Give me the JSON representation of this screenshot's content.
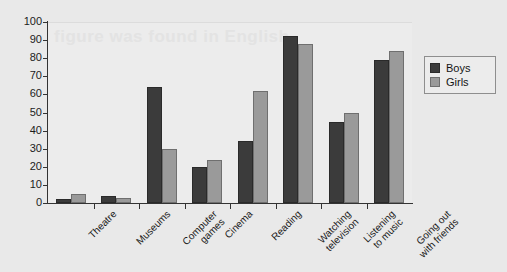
{
  "chart_data": {
    "type": "bar",
    "title": "",
    "xlabel": "",
    "ylabel": "",
    "ylim": [
      0,
      100
    ],
    "ytick_step": 10,
    "yticks": [
      0,
      10,
      20,
      30,
      40,
      50,
      60,
      70,
      80,
      90,
      100
    ],
    "grid": false,
    "legend_position": "top-right",
    "categories": [
      "Theatre",
      "Museums",
      "Computer\ngames",
      "Cinema",
      "Reading",
      "Watching\ntelevision",
      "Listening\nto music",
      "Going out\nwith friends"
    ],
    "series": [
      {
        "name": "Boys",
        "color": "#3b3b3b",
        "values": [
          2,
          4,
          64,
          20,
          34,
          92,
          45,
          79
        ]
      },
      {
        "name": "Girls",
        "color": "#9a9a9a",
        "values": [
          5,
          3,
          30,
          24,
          62,
          88,
          50,
          84
        ]
      }
    ]
  },
  "legend": {
    "entries": [
      {
        "label": "Boys"
      },
      {
        "label": "Girls"
      }
    ]
  },
  "watermark": {
    "text": "figure  was  found  in  English"
  },
  "colors": {
    "background": "#e9e9e9",
    "plot_background": "#ececec",
    "axis": "#333333",
    "boys": "#3b3b3b",
    "girls": "#9a9a9a"
  }
}
